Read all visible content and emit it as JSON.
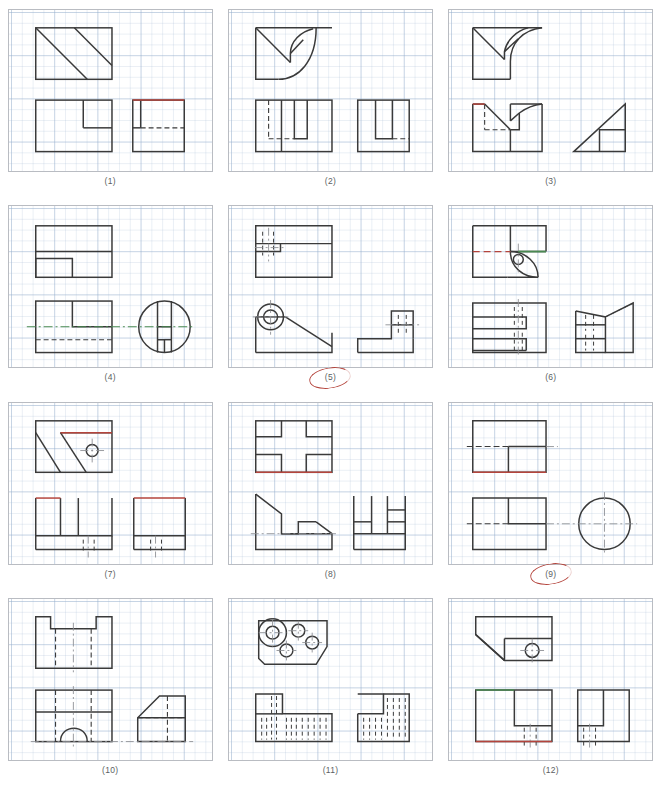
{
  "sheet": {
    "title": "Orthographic projection exercise sheet",
    "columns": 3,
    "rows": 4,
    "panel_count": 12,
    "background": "#ffffff",
    "grid_color": "#96afcd",
    "panel_border": "#b9bcc2",
    "line_color": "#3a3a3a",
    "accent_red": "#b4443c",
    "accent_green": "#4a8a52",
    "marker_red": "#b4443c"
  },
  "panels": [
    {
      "number": "(1)",
      "caption": "(1)",
      "marked": false,
      "views": [
        "top view with diagonal faces",
        "front view with step",
        "side view with hidden line"
      ],
      "accents": [
        "red top edge on side view"
      ]
    },
    {
      "number": "(2)",
      "caption": "(2)",
      "marked": false,
      "views": [
        "top view with fillet curves",
        "front view with slots",
        "side view with slot"
      ],
      "accents": []
    },
    {
      "number": "(3)",
      "caption": "(3)",
      "marked": false,
      "views": [
        "top view with fillet",
        "front view with hidden lines",
        "side view triangle"
      ],
      "accents": [
        "red edge on front view"
      ]
    },
    {
      "number": "(4)",
      "caption": "(4)",
      "marked": false,
      "views": [
        "top view with hidden line",
        "front view with step",
        "side view circular with slots"
      ],
      "accents": [
        "green centerline"
      ]
    },
    {
      "number": "(5)",
      "caption": "(5)",
      "marked": true,
      "views": [
        "top view with hidden slot",
        "front view with boss and incline",
        "side view Z shape"
      ],
      "accents": []
    },
    {
      "number": "(6)",
      "caption": "(6)",
      "marked": false,
      "views": [
        "top view with hole and fillet",
        "front view with slots",
        "side view tapered"
      ],
      "accents": [
        "red dashed centerline",
        "green solid edge"
      ]
    },
    {
      "number": "(7)",
      "caption": "(7)",
      "marked": false,
      "views": [
        "top view with diagonals and hole",
        "front view with slot",
        "side view with hidden hole"
      ],
      "accents": [
        "red top edges"
      ]
    },
    {
      "number": "(8)",
      "caption": "(8)",
      "marked": false,
      "views": [
        "top view cross pattern",
        "front view stepped profile",
        "side view blocks"
      ],
      "accents": [
        "red bottom edge"
      ]
    },
    {
      "number": "(9)",
      "caption": "(9)",
      "marked": true,
      "views": [
        "top view with step",
        "front view with step",
        "side view circle"
      ],
      "accents": [
        "red bottom edge"
      ]
    },
    {
      "number": "(10)",
      "caption": "(10)",
      "marked": false,
      "views": [
        "top view with notches",
        "front view with arch",
        "side view chamfered"
      ],
      "accents": []
    },
    {
      "number": "(11)",
      "caption": "(11)",
      "marked": false,
      "views": [
        "top view with four holes",
        "front view hatched",
        "side view hatched"
      ],
      "accents": []
    },
    {
      "number": "(12)",
      "caption": "(12)",
      "marked": false,
      "views": [
        "top view with chamfer and hole",
        "front view with pocket",
        "side view with pocket"
      ],
      "accents": [
        "green top edge",
        "red bottom edge"
      ]
    }
  ]
}
